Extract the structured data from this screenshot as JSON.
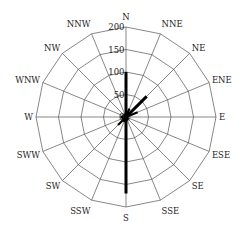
{
  "chart_data": {
    "type": "polar-bar",
    "title": "",
    "directions": [
      "N",
      "NNE",
      "NE",
      "ENE",
      "E",
      "ESE",
      "SE",
      "SSE",
      "S",
      "SSW",
      "SW",
      "SWW",
      "W",
      "WNW",
      "NW",
      "NNW"
    ],
    "values": [
      100,
      20,
      65,
      28,
      5,
      5,
      8,
      8,
      170,
      12,
      25,
      10,
      12,
      8,
      8,
      5
    ],
    "radial_ticks": [
      0,
      50,
      100,
      150,
      200
    ],
    "rlim": [
      0,
      200
    ],
    "grid": true,
    "legend": null,
    "colors": {
      "grid": "#555555",
      "data": "#000000",
      "text": "#222222"
    }
  }
}
